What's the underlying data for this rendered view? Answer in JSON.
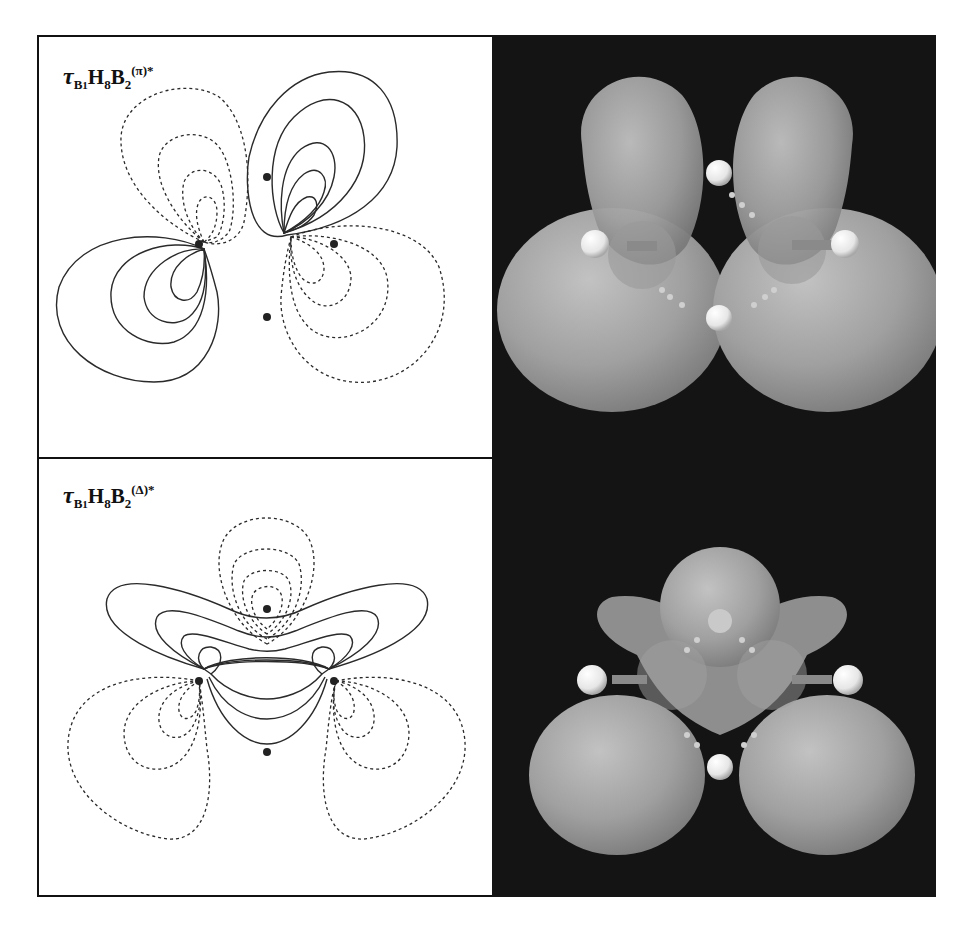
{
  "figure": {
    "panels": [
      {
        "id": "pi",
        "label": {
          "symbol": "τ",
          "sub1": "B",
          "sub1_index": "1",
          "mid": "H",
          "sub2": "8",
          "tail": "B",
          "sub3": "2",
          "superscript": "(π)*"
        },
        "contour_plot": "nodal contour map, solid = positive, dashed = negative",
        "isosurface": "3D orbital isosurface rendering"
      },
      {
        "id": "delta",
        "label": {
          "symbol": "τ",
          "sub1": "B",
          "sub1_index": "1",
          "mid": "H",
          "sub2": "8",
          "tail": "B",
          "sub3": "2",
          "superscript": "(Δ)*"
        },
        "contour_plot": "nodal contour map, solid = positive, dashed = negative",
        "isosurface": "3D orbital isosurface rendering"
      }
    ],
    "colors": {
      "contour": "#222222",
      "background_3d": "#141414",
      "lobe": "#9a9a9a",
      "atom": "#f2f2f2"
    }
  }
}
